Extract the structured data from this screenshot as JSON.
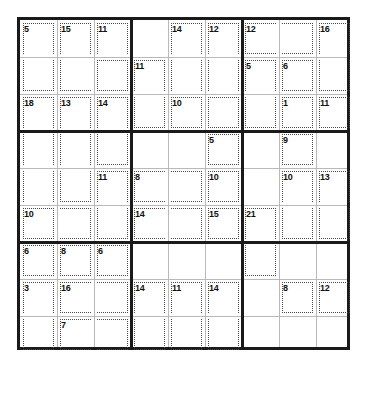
{
  "puzzle": {
    "type": "killer-sudoku",
    "title": "Killer Sudoku",
    "size": 9,
    "cell_px": 37,
    "grid_origin": {
      "x": 17,
      "y": 17
    },
    "colors": {
      "background": "#ffffff",
      "outer_border": "#1a1a1a",
      "box_border": "#1a1a1a",
      "cell_border": "#b9b9b9",
      "cage_border": "#4a4a4a",
      "sum_text": "#101010",
      "value_text": "#111111"
    },
    "givens": [],
    "cages": [
      {
        "id": "cage-r1c1",
        "sum": "5",
        "cells": [
          [
            0,
            0
          ],
          [
            1,
            0
          ]
        ]
      },
      {
        "id": "cage-r1c2",
        "sum": "15",
        "cells": [
          [
            0,
            1
          ],
          [
            1,
            1
          ],
          [
            1,
            2
          ]
        ]
      },
      {
        "id": "cage-r1c3",
        "sum": "11",
        "cells": [
          [
            0,
            2
          ],
          [
            1,
            2
          ]
        ]
      },
      {
        "id": "cage-r3c1",
        "sum": "18",
        "cells": [
          [
            2,
            0
          ],
          [
            3,
            0
          ],
          [
            4,
            0
          ],
          [
            5,
            0
          ]
        ]
      },
      {
        "id": "cage-r3c2",
        "sum": "13",
        "cells": [
          [
            2,
            1
          ],
          [
            3,
            1
          ],
          [
            4,
            1
          ]
        ]
      },
      {
        "id": "cage-r3c3",
        "sum": "14",
        "cells": [
          [
            2,
            2
          ],
          [
            3,
            2
          ]
        ]
      },
      {
        "id": "cage-r2c4",
        "sum": "11",
        "cells": [
          [
            1,
            3
          ],
          [
            2,
            3
          ]
        ]
      },
      {
        "id": "cage-r1c5",
        "sum": "14",
        "cells": [
          [
            0,
            4
          ],
          [
            1,
            4
          ],
          [
            2,
            4
          ]
        ]
      },
      {
        "id": "cage-r1c6",
        "sum": "12",
        "cells": [
          [
            0,
            5
          ],
          [
            1,
            5
          ],
          [
            2,
            5
          ]
        ]
      },
      {
        "id": "cage-r3c5",
        "sum": "10",
        "cells": [
          [
            2,
            4
          ],
          [
            2,
            5
          ]
        ]
      },
      {
        "id": "cage-r1c7",
        "sum": "12",
        "cells": [
          [
            0,
            6
          ],
          [
            0,
            7
          ]
        ]
      },
      {
        "id": "cage-r1c9",
        "sum": "16",
        "cells": [
          [
            0,
            8
          ],
          [
            1,
            8
          ]
        ]
      },
      {
        "id": "cage-r2c7",
        "sum": "5",
        "cells": [
          [
            1,
            6
          ],
          [
            2,
            6
          ]
        ]
      },
      {
        "id": "cage-r2c8",
        "sum": "6",
        "cells": [
          [
            1,
            7
          ]
        ]
      },
      {
        "id": "cage-r3c8",
        "sum": "1",
        "cells": [
          [
            2,
            7
          ]
        ]
      },
      {
        "id": "cage-r3c9",
        "sum": "11",
        "cells": [
          [
            2,
            8
          ]
        ]
      },
      {
        "id": "cage-r5c3",
        "sum": "11",
        "cells": [
          [
            4,
            2
          ],
          [
            5,
            2
          ]
        ]
      },
      {
        "id": "cage-r6c1",
        "sum": "10",
        "cells": [
          [
            5,
            0
          ],
          [
            5,
            1
          ]
        ]
      },
      {
        "id": "cage-r4c6",
        "sum": "5",
        "cells": [
          [
            3,
            5
          ]
        ]
      },
      {
        "id": "cage-r5c4",
        "sum": "8",
        "cells": [
          [
            4,
            3
          ],
          [
            4,
            4
          ]
        ]
      },
      {
        "id": "cage-r5c6",
        "sum": "10",
        "cells": [
          [
            4,
            5
          ]
        ]
      },
      {
        "id": "cage-r6c4",
        "sum": "14",
        "cells": [
          [
            5,
            3
          ],
          [
            5,
            4
          ]
        ]
      },
      {
        "id": "cage-r6c6",
        "sum": "15",
        "cells": [
          [
            5,
            5
          ]
        ]
      },
      {
        "id": "cage-r4c8",
        "sum": "9",
        "cells": [
          [
            3,
            7
          ]
        ]
      },
      {
        "id": "cage-r5c8",
        "sum": "10",
        "cells": [
          [
            4,
            7
          ],
          [
            5,
            7
          ]
        ]
      },
      {
        "id": "cage-r5c9",
        "sum": "13",
        "cells": [
          [
            4,
            8
          ],
          [
            5,
            8
          ]
        ]
      },
      {
        "id": "cage-r6c7",
        "sum": "21",
        "cells": [
          [
            5,
            6
          ],
          [
            6,
            6
          ]
        ]
      },
      {
        "id": "cage-r7c1",
        "sum": "6",
        "cells": [
          [
            6,
            0
          ]
        ]
      },
      {
        "id": "cage-r7c2",
        "sum": "8",
        "cells": [
          [
            6,
            1
          ]
        ]
      },
      {
        "id": "cage-r7c3",
        "sum": "6",
        "cells": [
          [
            6,
            2
          ]
        ]
      },
      {
        "id": "cage-r8c1",
        "sum": "3",
        "cells": [
          [
            7,
            0
          ],
          [
            8,
            0
          ]
        ]
      },
      {
        "id": "cage-r8c2",
        "sum": "16",
        "cells": [
          [
            7,
            1
          ],
          [
            7,
            2
          ]
        ]
      },
      {
        "id": "cage-r9c2",
        "sum": "7",
        "cells": [
          [
            8,
            1
          ],
          [
            8,
            2
          ]
        ]
      },
      {
        "id": "cage-r8c4",
        "sum": "14",
        "cells": [
          [
            7,
            3
          ],
          [
            8,
            3
          ]
        ]
      },
      {
        "id": "cage-r8c5",
        "sum": "11",
        "cells": [
          [
            7,
            4
          ],
          [
            8,
            4
          ]
        ]
      },
      {
        "id": "cage-r8c6",
        "sum": "14",
        "cells": [
          [
            7,
            5
          ],
          [
            8,
            5
          ]
        ]
      },
      {
        "id": "cage-r8c8",
        "sum": "8",
        "cells": [
          [
            7,
            7
          ]
        ]
      },
      {
        "id": "cage-r8c9",
        "sum": "12",
        "cells": [
          [
            7,
            8
          ]
        ]
      }
    ]
  }
}
